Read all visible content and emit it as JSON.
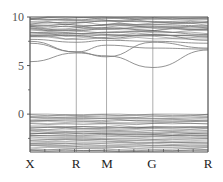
{
  "chart_data": {
    "type": "line",
    "title": "",
    "subtitle": "",
    "xlabel": "",
    "ylabel": "",
    "x_ticks": [
      "X",
      "R",
      "M",
      "G",
      "R"
    ],
    "x_tick_positions": [
      0,
      0.26,
      0.43,
      0.69,
      1.0
    ],
    "y_ticks": [
      0,
      5,
      10
    ],
    "ylim": [
      -3.9,
      10
    ],
    "grid": false,
    "legend": null,
    "regions": {
      "valence_band_top": 0,
      "valence_band_bottom": -3.8,
      "conduction_band_dense_range": [
        7.5,
        10
      ],
      "band_gap_approx": 5.4
    },
    "series": [
      {
        "name": "cb-lowest",
        "x": [
          0,
          0.26,
          0.43,
          0.69,
          1.0
        ],
        "values": [
          5.4,
          6.3,
          6.0,
          4.8,
          6.6
        ]
      },
      {
        "name": "cb-2",
        "x": [
          0,
          0.26,
          0.43,
          0.69,
          1.0
        ],
        "values": [
          7.3,
          6.4,
          7.1,
          6.8,
          6.7
        ]
      },
      {
        "name": "cb-3",
        "x": [
          0,
          0.26,
          0.43,
          0.69,
          1.0
        ],
        "values": [
          7.5,
          6.4,
          5.9,
          7.4,
          6.8
        ]
      },
      {
        "name": "cb-4",
        "x": [
          0,
          0.26,
          0.43,
          0.69,
          1.0
        ],
        "values": [
          7.7,
          7.4,
          7.6,
          7.5,
          7.3
        ]
      },
      {
        "name": "cb-5",
        "x": [
          0,
          0.26,
          0.43,
          0.69,
          1.0
        ],
        "values": [
          8.0,
          8.1,
          7.8,
          8.2,
          7.6
        ]
      },
      {
        "name": "cb-6",
        "x": [
          0,
          0.26,
          0.43,
          0.69,
          1.0
        ],
        "values": [
          8.4,
          8.3,
          8.4,
          8.5,
          8.2
        ]
      },
      {
        "name": "cb-7",
        "x": [
          0,
          0.26,
          0.43,
          0.69,
          1.0
        ],
        "values": [
          8.8,
          8.6,
          8.8,
          8.9,
          8.7
        ]
      },
      {
        "name": "cb-8",
        "x": [
          0,
          0.26,
          0.43,
          0.69,
          1.0
        ],
        "values": [
          9.1,
          9.0,
          9.2,
          9.2,
          9.1
        ]
      },
      {
        "name": "cb-9",
        "x": [
          0,
          0.26,
          0.43,
          0.69,
          1.0
        ],
        "values": [
          9.5,
          9.4,
          9.6,
          9.5,
          9.4
        ]
      },
      {
        "name": "cb-10",
        "x": [
          0,
          0.26,
          0.43,
          0.69,
          1.0
        ],
        "values": [
          9.8,
          9.7,
          9.9,
          9.8,
          9.8
        ]
      }
    ]
  },
  "axes": {
    "y_labels": [
      "10",
      "5",
      "0"
    ],
    "x_labels": [
      "X",
      "R",
      "M",
      "G",
      "R"
    ]
  },
  "colors": {
    "axis": "#555555",
    "band_line": "#777777",
    "dense_band": "#444444",
    "symmetry_line": "#999999",
    "background": "#ffffff"
  }
}
